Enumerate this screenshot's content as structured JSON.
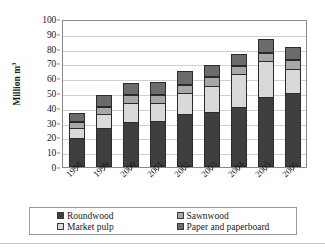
{
  "chart_data": {
    "type": "bar",
    "stacked": true,
    "title": "",
    "xlabel": "",
    "ylabel": "Million m³",
    "ylim": [
      0,
      100
    ],
    "ytick_step": 10,
    "yticks": [
      0,
      10,
      20,
      30,
      40,
      50,
      60,
      70,
      80,
      90,
      100
    ],
    "grid": true,
    "grid_axis": "y",
    "legend_position": "bottom",
    "legend_columns": 2,
    "categories": [
      "1998",
      "1999",
      "2000",
      "2001",
      "2002",
      "2003",
      "2004",
      "2005",
      "2006"
    ],
    "series": [
      {
        "name": "Roundwood",
        "color": "#3f3f3f",
        "values": [
          20,
          27,
          31,
          31.5,
          36,
          37.5,
          41,
          48,
          51
        ]
      },
      {
        "name": "Market pulp",
        "color": "#d9d9d9",
        "values": [
          7,
          9,
          13,
          12.5,
          15,
          18,
          22.5,
          24.5,
          16
        ]
      },
      {
        "name": "Sawnwood",
        "color": "#a8a8a8",
        "values": [
          4,
          5,
          5,
          5,
          5.5,
          6.5,
          5.5,
          5.5,
          6.5
        ]
      },
      {
        "name": "Paper and paperboard",
        "color": "#6b6b6b",
        "values": [
          6,
          8.5,
          8.5,
          9,
          9,
          8,
          8.5,
          10,
          9
        ]
      }
    ],
    "totals": [
      37,
      49.5,
      57.5,
      58,
      65.5,
      70,
      77.5,
      88,
      82.5
    ],
    "stack_order": [
      "Roundwood",
      "Market pulp",
      "Sawnwood",
      "Paper and paperboard"
    ]
  },
  "axes": {
    "y_title_text": "Million m",
    "y_title_sup": "3"
  },
  "legend": {
    "entries": [
      {
        "label": "Roundwood",
        "color": "#3f3f3f"
      },
      {
        "label": "Sawnwood",
        "color": "#a8a8a8"
      },
      {
        "label": "Market pulp",
        "color": "#d9d9d9"
      },
      {
        "label": "Paper and paperboard",
        "color": "#6b6b6b"
      }
    ]
  }
}
